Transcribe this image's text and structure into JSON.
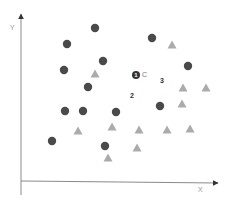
{
  "diagram": {
    "type": "scatter-clusters",
    "axes": {
      "x_label": "X",
      "y_label": "Y",
      "origin": [
        21,
        181
      ],
      "x_end": [
        218,
        181
      ],
      "y_end": [
        21,
        14
      ],
      "color": "#8a8a8a"
    },
    "series": [
      {
        "name": "circles",
        "shape": "circle",
        "color": "#4a4a4a",
        "points": [
          [
            95,
            28
          ],
          [
            67,
            44
          ],
          [
            152,
            38
          ],
          [
            103,
            61
          ],
          [
            64,
            70
          ],
          [
            188,
            66
          ],
          [
            88,
            87
          ],
          [
            160,
            106
          ],
          [
            65,
            111
          ],
          [
            83,
            111
          ],
          [
            116,
            112
          ],
          [
            52,
            141
          ],
          [
            105,
            146
          ]
        ]
      },
      {
        "name": "triangles",
        "shape": "triangle",
        "color": "#ababab",
        "points": [
          [
            172,
            45
          ],
          [
            95,
            74
          ],
          [
            183,
            88
          ],
          [
            206,
            88
          ],
          [
            182,
            104
          ],
          [
            78,
            131
          ],
          [
            112,
            127
          ],
          [
            139,
            130
          ],
          [
            167,
            130
          ],
          [
            190,
            129
          ],
          [
            137,
            148
          ],
          [
            108,
            158
          ]
        ]
      }
    ],
    "annotations": [
      {
        "id": "label-1",
        "text": "1",
        "style": "filled-circle",
        "x": 132,
        "y": 71
      },
      {
        "id": "label-c",
        "text": "C",
        "x": 142,
        "y": 71
      },
      {
        "id": "label-3",
        "text": "3",
        "x": 160,
        "y": 77
      },
      {
        "id": "label-2",
        "text": "2",
        "x": 130,
        "y": 92
      }
    ]
  }
}
